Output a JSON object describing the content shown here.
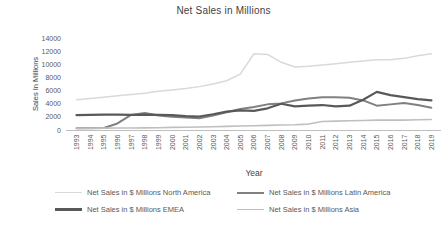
{
  "chart_data": {
    "type": "line",
    "title": "Net Sales in Millions",
    "xlabel": "Year",
    "ylabel": "Sales In Millions",
    "ylim": [
      0,
      14000
    ],
    "yticks": [
      0,
      2000,
      4000,
      6000,
      8000,
      10000,
      12000,
      14000
    ],
    "grid": false,
    "legend_position": "bottom",
    "axis_color": "#bfbfbf",
    "tick_color": "#595959",
    "title_color": "#3f3f3f",
    "categories": [
      "1993",
      "1994",
      "1995",
      "1996",
      "1997",
      "1998",
      "1999",
      "2000",
      "2001",
      "2002",
      "2003",
      "2004",
      "2005",
      "2006",
      "2007",
      "2008",
      "2009",
      "2010",
      "2011",
      "2012",
      "2013",
      "2014",
      "2015",
      "2016",
      "2017",
      "2018",
      "2019"
    ],
    "series": [
      {
        "name": "Net Sales in $ Millions North America",
        "color": "#d9d9d9",
        "width": 1.5,
        "values": [
          4600,
          4800,
          5000,
          5200,
          5400,
          5600,
          5900,
          6100,
          6300,
          6600,
          7000,
          7500,
          8500,
          11600,
          11500,
          10300,
          9600,
          9700,
          9900,
          10100,
          10300,
          10500,
          10700,
          10700,
          10900,
          11300,
          11600
        ]
      },
      {
        "name": "Net Sales in $ Millions Latin America",
        "color": "#808080",
        "width": 2,
        "values": [
          250,
          280,
          300,
          1000,
          2300,
          2600,
          2200,
          2000,
          1900,
          1800,
          2200,
          2700,
          3200,
          3500,
          3900,
          4050,
          4500,
          4800,
          5000,
          5000,
          4900,
          4500,
          3700,
          3900,
          4100,
          3800,
          3400
        ]
      },
      {
        "name": "Net Sales in $ Millions EMEA",
        "color": "#595959",
        "width": 2.2,
        "values": [
          2250,
          2300,
          2350,
          2350,
          2300,
          2350,
          2300,
          2250,
          2100,
          2050,
          2400,
          2800,
          3000,
          2900,
          3300,
          4000,
          3600,
          3700,
          3800,
          3600,
          3700,
          4600,
          5800,
          5300,
          5000,
          4700,
          4500
        ]
      },
      {
        "name": "Net Sales in $ Millions Asia",
        "color": "#bfbfbf",
        "width": 1.6,
        "values": [
          250,
          260,
          280,
          300,
          300,
          320,
          350,
          400,
          420,
          450,
          500,
          550,
          600,
          650,
          700,
          750,
          800,
          900,
          1300,
          1350,
          1400,
          1450,
          1500,
          1500,
          1500,
          1550,
          1600
        ]
      }
    ]
  }
}
